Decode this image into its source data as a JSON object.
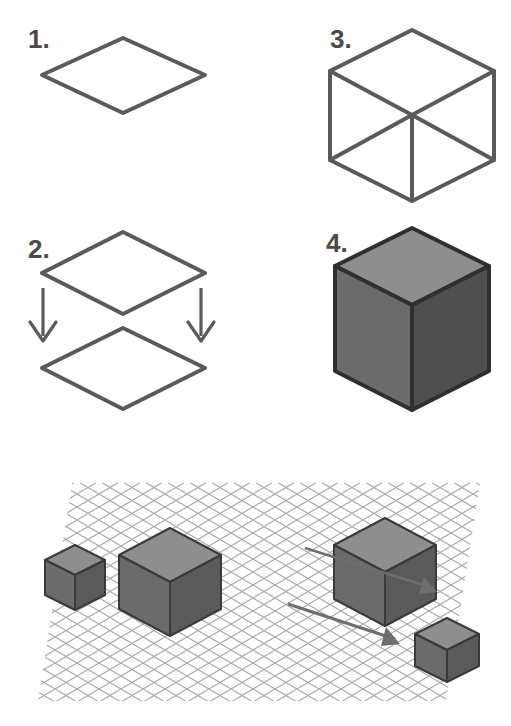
{
  "figure": {
    "background_color": "#ffffff",
    "line_color": "#5a5a5a",
    "label_color": "#4a4a4a"
  },
  "steps": [
    {
      "id": "step-1",
      "label": "1.",
      "caption": "Draw a rhombus (the top face)",
      "shape": "rhombus",
      "label_position": {
        "x": 28,
        "y": 48
      }
    },
    {
      "id": "step-2",
      "label": "2.",
      "caption": "Copy the rhombus and move it straight down",
      "shape": "two-rhombi-with-arrows",
      "label_position": {
        "x": 28,
        "y": 258
      },
      "arrows": [
        {
          "name": "down-arrow-left",
          "x1": 42,
          "y1": 288,
          "x2": 42,
          "y2": 340
        },
        {
          "name": "down-arrow-right",
          "x1": 200,
          "y1": 288,
          "x2": 200,
          "y2": 340
        }
      ]
    },
    {
      "id": "step-3",
      "label": "3.",
      "caption": "Connect the corners to form the wireframe cube",
      "shape": "wireframe-cube",
      "label_position": {
        "x": 330,
        "y": 48
      }
    },
    {
      "id": "step-4",
      "label": "4.",
      "caption": "Shade the three visible faces",
      "shape": "shaded-cube",
      "label_position": {
        "x": 326,
        "y": 252
      }
    }
  ],
  "cube_faces": {
    "top_color": "#8e8e8e",
    "left_color": "#6b6b6b",
    "right_color": "#4f4f4f",
    "outline_color": "#2f2f2f"
  },
  "bottom_panel": {
    "name": "isometric-grid-panel",
    "grid_color": "#a9a9a9",
    "grid_bounds": {
      "x": 38,
      "y": 483,
      "width": 442,
      "height": 218
    },
    "objects": [
      {
        "name": "small-cube-left",
        "size": "small",
        "cx": 75,
        "cy": 578
      },
      {
        "name": "large-cube-left",
        "size": "large",
        "cx": 170,
        "cy": 582
      },
      {
        "name": "large-cube-right",
        "size": "large",
        "cx": 385,
        "cy": 572
      },
      {
        "name": "small-cube-right",
        "size": "small",
        "cx": 447,
        "cy": 649
      }
    ],
    "arrows": [
      {
        "name": "scale-arrow-upper",
        "x1": 305,
        "y1": 548,
        "x2": 438,
        "y2": 590
      },
      {
        "name": "scale-arrow-lower",
        "x1": 288,
        "y1": 604,
        "x2": 400,
        "y2": 642
      }
    ]
  }
}
